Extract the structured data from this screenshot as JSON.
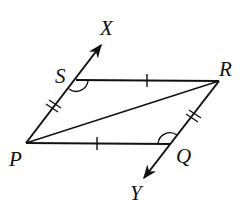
{
  "diagram": {
    "type": "geometry",
    "points": {
      "P": {
        "label": "P",
        "x": 26,
        "y": 143
      },
      "Q": {
        "label": "Q",
        "x": 170,
        "y": 144
      },
      "R": {
        "label": "R",
        "x": 219,
        "y": 81
      },
      "S": {
        "label": "S",
        "x": 76,
        "y": 80
      },
      "X": {
        "label": "X",
        "x": 102,
        "y": 43
      },
      "Y": {
        "label": "Y",
        "x": 143,
        "y": 180
      }
    },
    "segments": [
      "PS",
      "SR",
      "RQ",
      "QP",
      "PR"
    ],
    "rays": [
      "PX (through S)",
      "RY (through Q)"
    ],
    "tick_marks": {
      "single": [
        "SR",
        "PQ"
      ],
      "double": [
        "PS",
        "RQ"
      ]
    },
    "angle_marks": [
      "angle PSR",
      "angle RQP"
    ],
    "colors": {
      "stroke": "#111111",
      "background": "#ffffff"
    }
  }
}
